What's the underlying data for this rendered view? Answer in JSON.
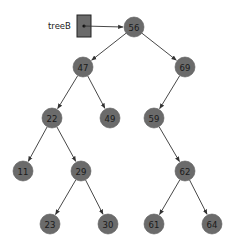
{
  "diagram": {
    "type": "binary-search-tree",
    "pointer": {
      "label": "treeB",
      "box": {
        "x": 77,
        "y": 15,
        "w": 14,
        "h": 22
      },
      "target": 0
    },
    "node_color": "#6b6b6b",
    "nodes": [
      {
        "id": 0,
        "value": "56",
        "x": 134,
        "y": 27
      },
      {
        "id": 1,
        "value": "47",
        "x": 83,
        "y": 67
      },
      {
        "id": 2,
        "value": "69",
        "x": 185,
        "y": 67
      },
      {
        "id": 3,
        "value": "22",
        "x": 52,
        "y": 118
      },
      {
        "id": 4,
        "value": "49",
        "x": 110,
        "y": 118
      },
      {
        "id": 5,
        "value": "59",
        "x": 154,
        "y": 118
      },
      {
        "id": 6,
        "value": "11",
        "x": 23,
        "y": 171
      },
      {
        "id": 7,
        "value": "29",
        "x": 81,
        "y": 171
      },
      {
        "id": 8,
        "value": "62",
        "x": 185,
        "y": 171
      },
      {
        "id": 9,
        "value": "23",
        "x": 50,
        "y": 224
      },
      {
        "id": 10,
        "value": "30",
        "x": 108,
        "y": 224
      },
      {
        "id": 11,
        "value": "61",
        "x": 154,
        "y": 224
      },
      {
        "id": 12,
        "value": "64",
        "x": 212,
        "y": 224
      }
    ],
    "edges": [
      [
        0,
        1
      ],
      [
        0,
        2
      ],
      [
        1,
        3
      ],
      [
        1,
        4
      ],
      [
        2,
        5
      ],
      [
        3,
        6
      ],
      [
        3,
        7
      ],
      [
        5,
        8
      ],
      [
        7,
        9
      ],
      [
        7,
        10
      ],
      [
        8,
        11
      ],
      [
        8,
        12
      ]
    ]
  }
}
